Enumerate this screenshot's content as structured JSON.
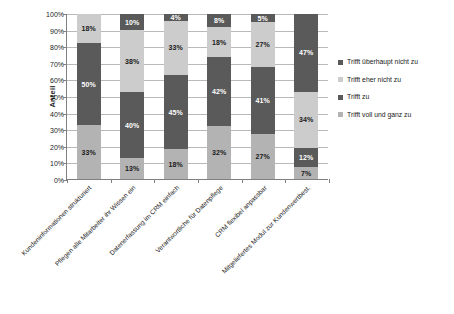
{
  "chart_data": {
    "type": "bar",
    "subtype": "stacked-100-percent",
    "title": "",
    "xlabel": "",
    "ylabel": "Anteil",
    "ylim": [
      0,
      100
    ],
    "ytick_labels": [
      "100%",
      "90%",
      "80%",
      "70%",
      "60%",
      "50%",
      "40%",
      "30%",
      "20%",
      "10%",
      "0%"
    ],
    "ytick_values": [
      100,
      90,
      80,
      70,
      60,
      50,
      40,
      30,
      20,
      10,
      0
    ],
    "grid": true,
    "legend_position": "right",
    "categories": [
      "Kundeninformationen strukturiert",
      "Pflegen alle Mitarbeiter ihr Wissen ein",
      "Datenerfassung im CRM einfach",
      "Verantwortliche für Datenpflege",
      "CRM flexibel anpassbar",
      "Mitgeliefertes Modul zur Kundenwertbest."
    ],
    "legend": [
      "Trifft überhaupt nicht zu",
      "Trifft eher nicht zu",
      "Trifft zu",
      "Trifft voll und ganz zu"
    ],
    "series": [
      {
        "name": "Trifft voll und ganz zu",
        "color": "#b3b3b3",
        "label_color": "dark",
        "values": [
          33,
          13,
          18,
          32,
          27,
          7
        ],
        "labels": [
          "33%",
          "13%",
          "18%",
          "32%",
          "27%",
          "7%"
        ]
      },
      {
        "name": "Trifft zu",
        "color": "#5a5a5a",
        "label_color": "light",
        "values": [
          50,
          40,
          45,
          42,
          41,
          12
        ],
        "labels": [
          "50%",
          "40%",
          "45%",
          "42%",
          "41%",
          "12%"
        ]
      },
      {
        "name": "Trifft eher nicht zu",
        "color": "#cccccc",
        "label_color": "dark",
        "values": [
          18,
          38,
          33,
          18,
          27,
          34
        ],
        "labels": [
          "18%",
          "38%",
          "33%",
          "18%",
          "27%",
          "34%"
        ]
      },
      {
        "name": "Trifft überhaupt nicht zu",
        "color": "#5a5a5a",
        "label_color": "light",
        "values": [
          0,
          10,
          4,
          8,
          5,
          47
        ],
        "labels": [
          "",
          "10%",
          "4%",
          "8%",
          "5%",
          "47%"
        ]
      }
    ]
  },
  "colors": {
    "dark_gray": "#5a5a5a",
    "mid_gray": "#b3b3b3",
    "light_gray": "#cccccc",
    "axis": "#808080",
    "gridline": "#b9b9b9",
    "text": "#1a1a1a",
    "background": "#ffffff"
  }
}
